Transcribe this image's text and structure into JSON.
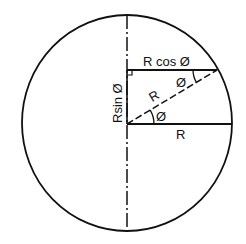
{
  "diagram": {
    "colors": {
      "stroke": "#111111",
      "background": "#ffffff"
    },
    "labels": {
      "r_cos_phi": "R cos Ø",
      "r_sin_phi": "Rsin Ø",
      "radius_diagonal": "R",
      "radius_horizontal": "R",
      "angle_at_center": "Ø",
      "angle_at_circle": "Ø"
    },
    "geometry": {
      "center": [
        127,
        123
      ],
      "radius": 106,
      "point_on_circle": [
        217,
        70
      ]
    }
  }
}
